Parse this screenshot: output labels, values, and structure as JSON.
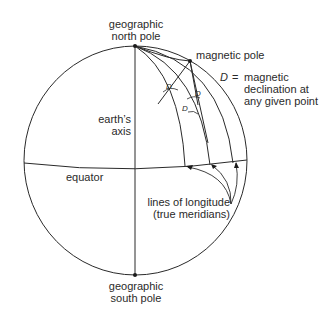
{
  "labels": {
    "north_pole": "geographic\nnorth pole",
    "south_pole": "geographic\nsouth pole",
    "magnetic_pole": "magnetic pole",
    "declination_symbol": "D",
    "declination_eq": " = ",
    "declination_def": "magnetic\ndeclination at\nany given point",
    "earths_axis": "earth’s\naxis",
    "equator": "equator",
    "longitude": "lines of longitude\n(true meridians)",
    "angle_marker": "D"
  },
  "colors": {
    "line": "#2a2a2a",
    "background": "#ffffff"
  }
}
